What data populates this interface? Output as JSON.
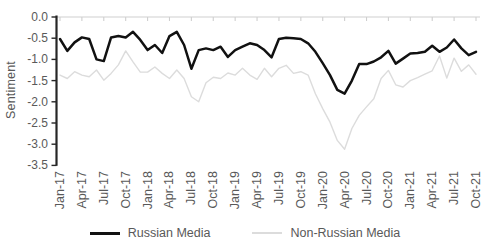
{
  "chart_data": {
    "type": "line",
    "title": "",
    "ylabel": "Sentiment",
    "xlabel": "",
    "ylim": [
      -3.5,
      0.0
    ],
    "grid": false,
    "legend_position": "bottom",
    "text_color": "#595959",
    "axis_color": "#262626",
    "category_axis_color": "#cfcfcf",
    "yticks": [
      "0.0",
      "-0.5",
      "-1.0",
      "-1.5",
      "-2.0",
      "-2.5",
      "-3.0",
      "-3.5"
    ],
    "ytick_values": [
      0.0,
      -0.5,
      -1.0,
      -1.5,
      -2.0,
      -2.5,
      -3.0,
      -3.5
    ],
    "xtick_labels": [
      "Jan-17",
      "Apr-17",
      "Jul-17",
      "Oct-17",
      "Jan-18",
      "Apr-18",
      "Jul-18",
      "Oct-18",
      "Jan-19",
      "Apr-19",
      "Jul-19",
      "Oct-19",
      "Jan-20",
      "Apr-20",
      "Jul-20",
      "Oct-20",
      "Jan-21",
      "Apr-21",
      "Jul-21",
      "Oct-21"
    ],
    "x": [
      "Jan-17",
      "Feb-17",
      "Mar-17",
      "Apr-17",
      "May-17",
      "Jun-17",
      "Jul-17",
      "Aug-17",
      "Sep-17",
      "Oct-17",
      "Nov-17",
      "Dec-17",
      "Jan-18",
      "Feb-18",
      "Mar-18",
      "Apr-18",
      "May-18",
      "Jun-18",
      "Jul-18",
      "Aug-18",
      "Sep-18",
      "Oct-18",
      "Nov-18",
      "Dec-18",
      "Jan-19",
      "Feb-19",
      "Mar-19",
      "Apr-19",
      "May-19",
      "Jun-19",
      "Jul-19",
      "Aug-19",
      "Sep-19",
      "Oct-19",
      "Nov-19",
      "Dec-19",
      "Jan-20",
      "Feb-20",
      "Mar-20",
      "Apr-20",
      "May-20",
      "Jun-20",
      "Jul-20",
      "Aug-20",
      "Sep-20",
      "Oct-20",
      "Nov-20",
      "Dec-20",
      "Jan-21",
      "Feb-21",
      "Mar-21",
      "Apr-21",
      "May-21",
      "Jun-21",
      "Jul-21",
      "Aug-21",
      "Sep-21",
      "Oct-21"
    ],
    "series": [
      {
        "name": "Russian Media",
        "color": "#111111",
        "stroke_width": 2.5,
        "values": [
          -0.52,
          -0.8,
          -0.6,
          -0.48,
          -0.52,
          -1.0,
          -1.04,
          -0.48,
          -0.45,
          -0.48,
          -0.35,
          -0.54,
          -0.78,
          -0.66,
          -0.85,
          -0.45,
          -0.35,
          -0.66,
          -1.22,
          -0.78,
          -0.74,
          -0.78,
          -0.7,
          -0.94,
          -0.78,
          -0.7,
          -0.62,
          -0.66,
          -0.78,
          -0.95,
          -0.52,
          -0.49,
          -0.5,
          -0.52,
          -0.62,
          -0.82,
          -1.09,
          -1.37,
          -1.72,
          -1.81,
          -1.5,
          -1.11,
          -1.11,
          -1.05,
          -0.95,
          -0.8,
          -1.1,
          -0.98,
          -0.86,
          -0.85,
          -0.82,
          -0.68,
          -0.82,
          -0.72,
          -0.53,
          -0.74,
          -0.9,
          -0.82
        ]
      },
      {
        "name": "Non-Russian Media",
        "color": "#dcdcdc",
        "stroke_width": 1.4,
        "values": [
          -1.37,
          -1.45,
          -1.29,
          -1.37,
          -1.41,
          -1.25,
          -1.49,
          -1.33,
          -1.13,
          -0.8,
          -1.06,
          -1.3,
          -1.3,
          -1.18,
          -1.33,
          -1.45,
          -1.25,
          -1.45,
          -1.88,
          -2.0,
          -1.55,
          -1.42,
          -1.45,
          -1.32,
          -1.37,
          -1.21,
          -1.37,
          -1.47,
          -1.21,
          -1.41,
          -1.21,
          -1.14,
          -1.33,
          -1.29,
          -1.37,
          -1.81,
          -2.16,
          -2.48,
          -2.91,
          -3.12,
          -2.63,
          -2.32,
          -2.12,
          -1.93,
          -1.45,
          -1.26,
          -1.6,
          -1.65,
          -1.5,
          -1.43,
          -1.35,
          -1.27,
          -0.92,
          -1.44,
          -0.97,
          -1.28,
          -1.13,
          -1.35
        ]
      }
    ]
  }
}
